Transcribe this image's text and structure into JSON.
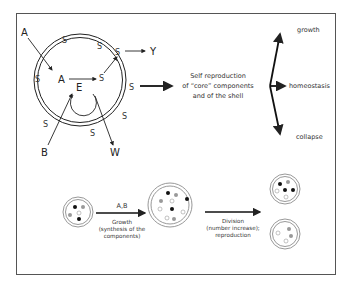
{
  "cell_diagram": {
    "external_inputs": [
      "A",
      "B"
    ],
    "internal_labels": {
      "a": "A",
      "e": "E"
    },
    "shell_component": "S",
    "outputs": [
      "Y",
      "W"
    ]
  },
  "process_text": {
    "line1": "Self reproduction",
    "line2": "of “core” components",
    "line3": "and of the shell"
  },
  "outcomes": [
    "growth",
    "homeostasis",
    "collapse"
  ],
  "lower_panel": {
    "growth_arrow_label": "A,B",
    "growth_caption": [
      "Growth",
      "(synthesis of the",
      "components)"
    ],
    "division_caption": [
      "Division",
      "(number increase);",
      "reproduction"
    ]
  },
  "colors": {
    "line": "#222222",
    "shell_fill": "#bbbbbb",
    "black_dot": "#111111",
    "gray_dot": "#999999",
    "white_dot": "#ffffff"
  }
}
